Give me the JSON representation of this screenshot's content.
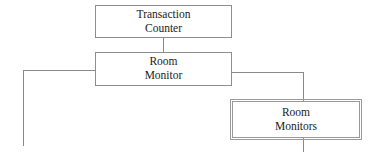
{
  "diagram": {
    "background_color": "#ffffff",
    "line_color": "#8a8a8a",
    "text_color": "#1b1b1b",
    "nodes": [
      {
        "id": "transaction-counter",
        "line1": "Transaction",
        "line2": "Counter",
        "border_style": "single",
        "border_color": "#8e8e8e"
      },
      {
        "id": "room-monitor",
        "line1": "Room",
        "line2": "Monitor",
        "border_style": "single",
        "border_color": "#8e8e8e"
      },
      {
        "id": "room-monitors",
        "line1": "Room",
        "line2": "Monitors",
        "border_style": "double",
        "border_color": "#9a9a9a"
      }
    ],
    "connectors": [
      {
        "id": "counter-to-monitor",
        "kind": "vertical"
      },
      {
        "id": "monitor-left-branch-horizontal",
        "kind": "horizontal"
      },
      {
        "id": "monitor-left-branch-vertical",
        "kind": "vertical"
      },
      {
        "id": "monitor-right-branch-horizontal",
        "kind": "horizontal"
      },
      {
        "id": "monitor-right-branch-vertical",
        "kind": "vertical"
      },
      {
        "id": "monitors-bottom-stub",
        "kind": "vertical"
      }
    ]
  }
}
